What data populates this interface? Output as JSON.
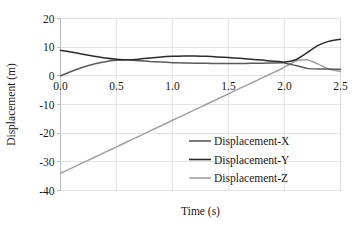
{
  "chart_data": {
    "type": "line",
    "title": "",
    "xlabel": "Time (s)",
    "ylabel": "Displacement (m)",
    "xlim": [
      0.0,
      2.5
    ],
    "ylim": [
      -40,
      20
    ],
    "xticks": [
      "0.0",
      "0.5",
      "1.0",
      "1.5",
      "2.0",
      "2.5"
    ],
    "xtick_values": [
      0.0,
      0.5,
      1.0,
      1.5,
      2.0,
      2.5
    ],
    "yticks": [
      "20",
      "10",
      "0",
      "-10",
      "-20",
      "-30",
      "-40"
    ],
    "ytick_values": [
      20,
      10,
      0,
      -10,
      -20,
      -30,
      -40
    ],
    "grid": "both",
    "legend_position": "inside-lower-right",
    "x": [
      0.0,
      0.1,
      0.2,
      0.3,
      0.4,
      0.5,
      0.6,
      0.7,
      0.8,
      0.9,
      1.0,
      1.1,
      1.2,
      1.3,
      1.4,
      1.5,
      1.6,
      1.7,
      1.8,
      1.9,
      2.0,
      2.1,
      2.2,
      2.3,
      2.4,
      2.5
    ],
    "series": [
      {
        "name": "Displacement-X",
        "color": "#5a5a5a",
        "values": [
          0.0,
          1.6,
          3.0,
          4.1,
          4.9,
          5.4,
          5.6,
          5.3,
          5.0,
          4.8,
          4.6,
          4.5,
          4.4,
          4.35,
          4.3,
          4.3,
          4.3,
          4.35,
          4.4,
          4.5,
          4.5,
          3.6,
          2.6,
          2.4,
          2.35,
          2.3
        ]
      },
      {
        "name": "Displacement-Y",
        "color": "#2b2b2b",
        "values": [
          8.9,
          8.3,
          7.5,
          6.8,
          6.2,
          5.8,
          5.6,
          5.8,
          6.2,
          6.6,
          6.8,
          6.9,
          6.9,
          6.8,
          6.6,
          6.4,
          6.1,
          5.8,
          5.5,
          5.1,
          4.8,
          5.6,
          8.0,
          10.6,
          12.1,
          12.8
        ]
      },
      {
        "name": "Displacement-Z",
        "color": "#a0a0a0",
        "values": [
          -34.0,
          -32.2,
          -30.3,
          -28.5,
          -26.6,
          -24.8,
          -22.9,
          -21.1,
          -19.2,
          -17.4,
          -15.5,
          -13.7,
          -11.8,
          -10.0,
          -8.1,
          -6.3,
          -4.4,
          -2.6,
          -0.7,
          1.1,
          3.0,
          5.2,
          5.6,
          4.1,
          2.3,
          1.5
        ]
      }
    ]
  },
  "legend": {
    "items": [
      {
        "label": "Displacement-X",
        "color": "#5a5a5a"
      },
      {
        "label": "Displacement-Y",
        "color": "#2b2b2b"
      },
      {
        "label": "Displacement-Z",
        "color": "#a0a0a0"
      }
    ]
  }
}
